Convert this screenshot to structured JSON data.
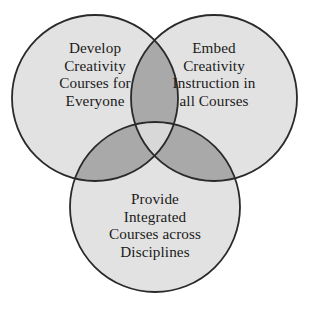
{
  "diagram": {
    "type": "venn-3-circle",
    "background_color": "#ffffff",
    "outline_color": "#2a2a2a",
    "fill_color": "#e2e2e2",
    "pair_overlap_color": "#a9a9a9",
    "triple_overlap_color": "#d8d8d8",
    "circles": [
      {
        "id": "left",
        "name": "develop-creativity-courses",
        "cx": 95,
        "cy": 98,
        "r": 83,
        "lines": [
          "Develop",
          "Creativity",
          "Courses for",
          "Everyone"
        ]
      },
      {
        "id": "right",
        "name": "embed-creativity-instruction",
        "cx": 214,
        "cy": 98,
        "r": 83,
        "lines": [
          "Embed",
          "Creativity",
          "Instruction in",
          "all Courses"
        ]
      },
      {
        "id": "bottom",
        "name": "provide-integrated-courses",
        "cx": 155,
        "cy": 207,
        "r": 85,
        "lines": [
          "Provide",
          "Integrated",
          "Courses across",
          "Disciplines"
        ]
      }
    ]
  },
  "labels": {
    "left": {
      "line1": "Develop",
      "line2": "Creativity",
      "line3": "Courses for",
      "line4": "Everyone"
    },
    "right": {
      "line1": "Embed",
      "line2": "Creativity",
      "line3": "Instruction in",
      "line4": "all Courses"
    },
    "bottom": {
      "line1": "Provide",
      "line2": "Integrated",
      "line3": "Courses across",
      "line4": "Disciplines"
    }
  }
}
